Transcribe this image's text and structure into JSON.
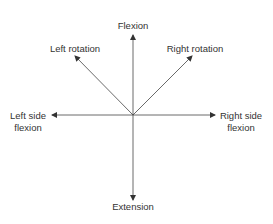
{
  "diagram": {
    "labels": {
      "flexion": "Flexion",
      "extension": "Extension",
      "left_rotation": "Left rotation",
      "right_rotation": "Right rotation",
      "left_side_1": "Left side",
      "left_side_2": "flexion",
      "right_side_1": "Right side",
      "right_side_2": "flexion"
    },
    "colors": {
      "line": "#333333",
      "text": "#333333"
    }
  }
}
